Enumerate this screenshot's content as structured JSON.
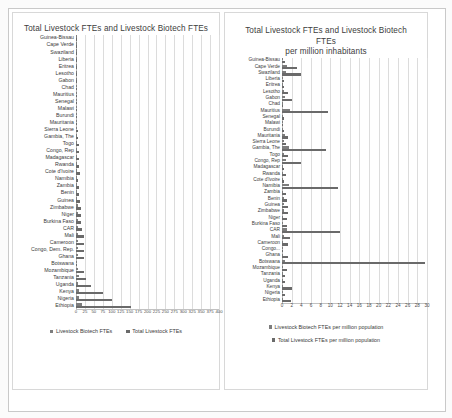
{
  "figure": {
    "background": "#ffffff",
    "series_colors": {
      "biotech": "#7d7d7d",
      "total": "#6a6a6a"
    }
  },
  "left_panel": {
    "title": "Total Livestock FTEs and Livestock Biotech FTEs",
    "legend": [
      {
        "label": "Livestock Biotech FTEs",
        "color": "#7d7d7d"
      },
      {
        "label": "Total Livestock FTEs",
        "color": "#6a6a6a"
      }
    ]
  },
  "right_panel": {
    "title_line1": "Total Livestock FTEs and Livestock Biotech",
    "title_line2": "FTEs",
    "title_line3": "per million inhabitants",
    "legend": [
      {
        "label": "Livestock Biotech FTEs per million population",
        "color": "#7d7d7d"
      },
      {
        "label": "Total Livestock FTEs per million population",
        "color": "#6a6a6a"
      }
    ]
  },
  "chart_data": [
    {
      "id": "absolute-ftes",
      "type": "bar",
      "orientation": "horizontal",
      "title": "Total Livestock FTEs and Livestock Biotech FTEs",
      "xlabel": "",
      "ylabel": "",
      "xlim": [
        0,
        400
      ],
      "grid": true,
      "legend_position": "bottom",
      "ticks": [
        0,
        25,
        50,
        75,
        100,
        125,
        150,
        175,
        200,
        225,
        250,
        275,
        300,
        325,
        350,
        375,
        400
      ],
      "categories": [
        "Guinea-Bissau",
        "Cape Verde",
        "Swaziland",
        "Liberia",
        "Eritrea",
        "Lesotho",
        "Gabon",
        "Chad",
        "Mauritius",
        "Senegal",
        "Malawi",
        "Burundi",
        "Mauritania",
        "Sierra Leone",
        "Gambia, The",
        "Togo",
        "Congo, Rep",
        "Madagascar",
        "Rwanda",
        "Cote d'Ivoire",
        "Namibia",
        "Zambia",
        "Benin",
        "Guinea",
        "Zimbabwe",
        "Niger",
        "Burkina Faso",
        "CAR",
        "Mali",
        "Cameroon",
        "Congo, Dem. Rep.",
        "Ghana",
        "Botswana",
        "Mozambique",
        "Tanzania",
        "Uganda",
        "Kenya",
        "Nigeria",
        "Ethiopia"
      ],
      "series": [
        {
          "name": "Livestock Biotech FTEs",
          "color": "#7d7d7d",
          "values": [
            0.3,
            0.5,
            1,
            0.5,
            1.5,
            1,
            1,
            1,
            1.5,
            1.5,
            1.5,
            1.5,
            2,
            2,
            2.5,
            3,
            3,
            3.5,
            3.5,
            4,
            3,
            4,
            4,
            4,
            6,
            5,
            5,
            5,
            6,
            6,
            6,
            6,
            1,
            6,
            9,
            6,
            9,
            9,
            17
          ]
        },
        {
          "name": "Total Livestock FTEs",
          "color": "#6a6a6a",
          "values": [
            1,
            1.5,
            2,
            1,
            2,
            2.5,
            3,
            3,
            3,
            4,
            2.5,
            4,
            4,
            5,
            6,
            9,
            9,
            9,
            9,
            10,
            6,
            9,
            9,
            12,
            15,
            14,
            15,
            17,
            21,
            21,
            22,
            22,
            4,
            21,
            28,
            42,
            76,
            102,
            155
          ]
        }
      ]
    },
    {
      "id": "per-million-ftes",
      "type": "bar",
      "orientation": "horizontal",
      "title": "Total Livestock FTEs and Livestock Biotech FTEs per million inhabitants",
      "xlabel": "",
      "ylabel": "",
      "xlim": [
        0,
        30
      ],
      "grid": true,
      "legend_position": "bottom",
      "ticks": [
        0,
        2,
        4,
        6,
        8,
        10,
        12,
        14,
        16,
        18,
        20,
        22,
        24,
        26,
        28,
        30
      ],
      "categories": [
        "Guinea-Bissau",
        "Cape Verde",
        "Swaziland",
        "Liberia",
        "Eritrea",
        "Lesotho",
        "Gabon",
        "Chad",
        "Mauritius",
        "Senegal",
        "Malawi",
        "Burundi",
        "Mauritania",
        "Sierra Leone",
        "Gambia, The",
        "Togo",
        "Congo, Rep",
        "Madagascar",
        "Rwanda",
        "Cote d'Ivoire",
        "Namibia",
        "Zambia",
        "Benin",
        "Guinea",
        "Zimbabwe",
        "Niger",
        "Burkina Faso",
        "CAR",
        "Mali",
        "Cameroon",
        "Congo...",
        "Ghana",
        "Botswana",
        "Mozambique",
        "Tanzania",
        "Uganda",
        "Kenya",
        "Nigeria",
        "Ethiopia"
      ],
      "series": [
        {
          "name": "Livestock Biotech FTEs per million population",
          "color": "#7d7d7d",
          "values": [
            0.2,
            1.0,
            0.9,
            0.2,
            0.3,
            0.5,
            0.6,
            0.1,
            1.6,
            0.1,
            0.1,
            0.2,
            0.6,
            0.4,
            1.4,
            0.4,
            0.8,
            0.2,
            0.3,
            0.2,
            1.4,
            0.3,
            0.4,
            0.4,
            0.5,
            0.3,
            0.3,
            1.1,
            0.4,
            0.3,
            0.1,
            0.3,
            0.6,
            0.3,
            0.2,
            0.2,
            0.2,
            0.1,
            0.2
          ]
        },
        {
          "name": "Total Livestock FTEs per million population",
          "color": "#6a6a6a",
          "values": [
            0.6,
            3.0,
            4.0,
            0.4,
            0.5,
            1.3,
            2.0,
            0.2,
            9.5,
            0.4,
            0.2,
            0.5,
            1.3,
            0.9,
            9.0,
            1.3,
            4.0,
            0.5,
            0.9,
            0.5,
            11.5,
            0.8,
            1.0,
            1.2,
            1.2,
            1.0,
            1.0,
            12.0,
            1.6,
            1.2,
            0.1,
            1.2,
            29.5,
            1.0,
            0.7,
            0.7,
            2.0,
            0.7,
            1.8
          ]
        }
      ]
    }
  ]
}
